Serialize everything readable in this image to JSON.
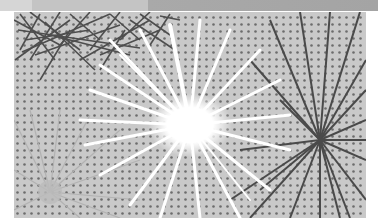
{
  "image": {
    "description": "Grayscale manga-style halftone illustration of fireworks bursts",
    "colors": {
      "background": "#ffffff",
      "halftone_base": "#c8c8c8",
      "dot": "#6a6a6a",
      "dark_stroke": "#4a4a4a",
      "burst": "#ffffff",
      "top_strip": "#a9a9a9"
    },
    "elements": [
      {
        "name": "white-burst",
        "cx": 190,
        "cy": 125
      },
      {
        "name": "gray-burst",
        "cx": 50,
        "cy": 192
      },
      {
        "name": "dark-burst",
        "cx": 320,
        "cy": 140
      },
      {
        "name": "dark-scribbles",
        "region": "top-left"
      }
    ]
  }
}
